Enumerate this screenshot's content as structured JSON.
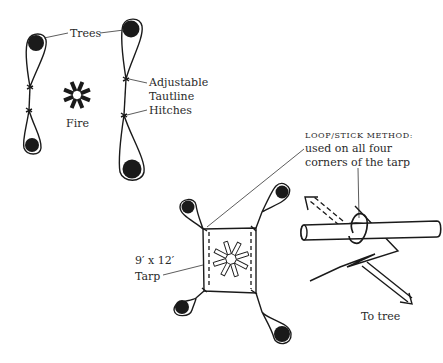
{
  "labels": {
    "trees": "Trees",
    "hitch_line1": "Adjustable",
    "hitch_line2": "Tautline",
    "hitch_line3": "Hitches",
    "fire": "Fire",
    "tarp_size": "9′ x 12′",
    "tarp": "Tarp",
    "method_title": "LOOP/STICK METHOD:",
    "method_line1": "used on all four",
    "method_line2": "corners of the tarp",
    "to_tree": "To tree"
  },
  "colors": {
    "ink": "#1a1a1a",
    "background": "#ffffff"
  }
}
